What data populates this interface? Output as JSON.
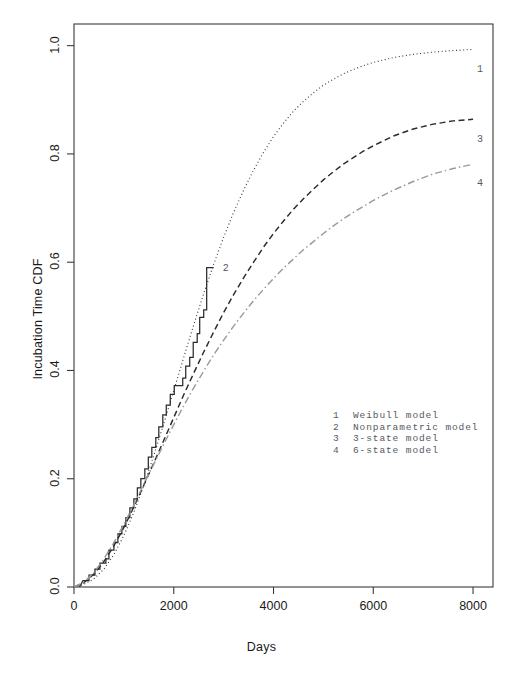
{
  "chart_data": {
    "type": "line",
    "title": "",
    "xlabel": "Days",
    "ylabel": "Incubation Time CDF",
    "xlim": [
      0,
      8400
    ],
    "ylim": [
      0.0,
      1.04
    ],
    "xticks": [
      0,
      2000,
      4000,
      6000,
      8000
    ],
    "xticklabels": [
      "0",
      "2000",
      "4000",
      "6000",
      "8000"
    ],
    "yticks": [
      0.0,
      0.2,
      0.4,
      0.6,
      0.8,
      1.0
    ],
    "yticklabels": [
      "0.0",
      "0.2",
      "0.4",
      "0.6",
      "0.8",
      "1.0"
    ],
    "grid": false,
    "legend_position": "inside-lower-right",
    "series": [
      {
        "key": "1",
        "name": "Weibull model",
        "style": "dotted",
        "color": "#3c3c3c",
        "end_value": 0.99,
        "points": [
          [
            0,
            0.0
          ],
          [
            200,
            0.005
          ],
          [
            400,
            0.015
          ],
          [
            600,
            0.033
          ],
          [
            800,
            0.06
          ],
          [
            1000,
            0.095
          ],
          [
            1200,
            0.138
          ],
          [
            1400,
            0.188
          ],
          [
            1600,
            0.243
          ],
          [
            1800,
            0.302
          ],
          [
            2000,
            0.363
          ],
          [
            2200,
            0.424
          ],
          [
            2400,
            0.484
          ],
          [
            2600,
            0.542
          ],
          [
            2800,
            0.596
          ],
          [
            3000,
            0.646
          ],
          [
            3200,
            0.692
          ],
          [
            3400,
            0.733
          ],
          [
            3600,
            0.77
          ],
          [
            3800,
            0.803
          ],
          [
            4000,
            0.832
          ],
          [
            4200,
            0.857
          ],
          [
            4400,
            0.879
          ],
          [
            4600,
            0.897
          ],
          [
            4800,
            0.913
          ],
          [
            5000,
            0.927
          ],
          [
            5200,
            0.938
          ],
          [
            5400,
            0.948
          ],
          [
            5600,
            0.956
          ],
          [
            5800,
            0.963
          ],
          [
            6000,
            0.969
          ],
          [
            6400,
            0.978
          ],
          [
            6800,
            0.984
          ],
          [
            7200,
            0.988
          ],
          [
            7600,
            0.991
          ],
          [
            8000,
            0.993
          ]
        ]
      },
      {
        "key": "2",
        "name": "Nonparametric model",
        "style": "step",
        "color": "#2b2b2b",
        "end_value": 0.59,
        "points": [
          [
            110,
            0.0
          ],
          [
            180,
            0.012
          ],
          [
            300,
            0.012
          ],
          [
            300,
            0.022
          ],
          [
            420,
            0.022
          ],
          [
            420,
            0.033
          ],
          [
            520,
            0.033
          ],
          [
            520,
            0.044
          ],
          [
            640,
            0.044
          ],
          [
            640,
            0.052
          ],
          [
            700,
            0.052
          ],
          [
            700,
            0.068
          ],
          [
            800,
            0.068
          ],
          [
            800,
            0.082
          ],
          [
            880,
            0.082
          ],
          [
            880,
            0.098
          ],
          [
            960,
            0.098
          ],
          [
            960,
            0.112
          ],
          [
            1040,
            0.112
          ],
          [
            1040,
            0.128
          ],
          [
            1120,
            0.128
          ],
          [
            1120,
            0.146
          ],
          [
            1200,
            0.146
          ],
          [
            1200,
            0.163
          ],
          [
            1270,
            0.163
          ],
          [
            1270,
            0.183
          ],
          [
            1340,
            0.183
          ],
          [
            1340,
            0.2
          ],
          [
            1420,
            0.2
          ],
          [
            1420,
            0.218
          ],
          [
            1490,
            0.218
          ],
          [
            1490,
            0.24
          ],
          [
            1560,
            0.24
          ],
          [
            1560,
            0.258
          ],
          [
            1640,
            0.258
          ],
          [
            1640,
            0.276
          ],
          [
            1700,
            0.276
          ],
          [
            1700,
            0.296
          ],
          [
            1780,
            0.296
          ],
          [
            1780,
            0.318
          ],
          [
            1850,
            0.318
          ],
          [
            1850,
            0.336
          ],
          [
            1930,
            0.336
          ],
          [
            1930,
            0.356
          ],
          [
            2010,
            0.356
          ],
          [
            2010,
            0.372
          ],
          [
            2180,
            0.372
          ],
          [
            2180,
            0.386
          ],
          [
            2240,
            0.386
          ],
          [
            2240,
            0.408
          ],
          [
            2320,
            0.408
          ],
          [
            2320,
            0.424
          ],
          [
            2390,
            0.424
          ],
          [
            2390,
            0.452
          ],
          [
            2470,
            0.452
          ],
          [
            2470,
            0.468
          ],
          [
            2520,
            0.468
          ],
          [
            2520,
            0.498
          ],
          [
            2600,
            0.498
          ],
          [
            2600,
            0.512
          ],
          [
            2660,
            0.512
          ],
          [
            2660,
            0.59
          ],
          [
            2800,
            0.59
          ]
        ]
      },
      {
        "key": "3",
        "name": "3-state model",
        "style": "dashed",
        "color": "#2b2b2b",
        "end_value": 0.86,
        "points": [
          [
            0,
            0.0
          ],
          [
            200,
            0.008
          ],
          [
            400,
            0.024
          ],
          [
            600,
            0.047
          ],
          [
            800,
            0.076
          ],
          [
            1000,
            0.11
          ],
          [
            1200,
            0.148
          ],
          [
            1400,
            0.188
          ],
          [
            1600,
            0.229
          ],
          [
            1800,
            0.271
          ],
          [
            2000,
            0.313
          ],
          [
            2200,
            0.355
          ],
          [
            2400,
            0.395
          ],
          [
            2600,
            0.434
          ],
          [
            2800,
            0.471
          ],
          [
            3000,
            0.507
          ],
          [
            3200,
            0.54
          ],
          [
            3400,
            0.571
          ],
          [
            3600,
            0.6
          ],
          [
            3800,
            0.628
          ],
          [
            4000,
            0.653
          ],
          [
            4200,
            0.676
          ],
          [
            4400,
            0.698
          ],
          [
            4600,
            0.717
          ],
          [
            4800,
            0.735
          ],
          [
            5000,
            0.752
          ],
          [
            5200,
            0.767
          ],
          [
            5400,
            0.781
          ],
          [
            5600,
            0.793
          ],
          [
            5800,
            0.805
          ],
          [
            6000,
            0.815
          ],
          [
            6400,
            0.833
          ],
          [
            6800,
            0.846
          ],
          [
            7200,
            0.855
          ],
          [
            7600,
            0.861
          ],
          [
            8000,
            0.864
          ]
        ]
      },
      {
        "key": "4",
        "name": "6-state model",
        "style": "dashdot",
        "color": "#9a9a9a",
        "end_value": 0.78,
        "points": [
          [
            0,
            0.0
          ],
          [
            200,
            0.009
          ],
          [
            400,
            0.027
          ],
          [
            600,
            0.052
          ],
          [
            800,
            0.082
          ],
          [
            1000,
            0.116
          ],
          [
            1200,
            0.152
          ],
          [
            1400,
            0.19
          ],
          [
            1600,
            0.227
          ],
          [
            1800,
            0.264
          ],
          [
            2000,
            0.3
          ],
          [
            2200,
            0.335
          ],
          [
            2400,
            0.368
          ],
          [
            2600,
            0.399
          ],
          [
            2800,
            0.429
          ],
          [
            3000,
            0.456
          ],
          [
            3200,
            0.482
          ],
          [
            3400,
            0.506
          ],
          [
            3600,
            0.529
          ],
          [
            3800,
            0.55
          ],
          [
            4000,
            0.57
          ],
          [
            4200,
            0.589
          ],
          [
            4400,
            0.606
          ],
          [
            4600,
            0.623
          ],
          [
            4800,
            0.638
          ],
          [
            5000,
            0.653
          ],
          [
            5200,
            0.667
          ],
          [
            5400,
            0.68
          ],
          [
            5600,
            0.692
          ],
          [
            5800,
            0.703
          ],
          [
            6000,
            0.714
          ],
          [
            6400,
            0.733
          ],
          [
            6800,
            0.749
          ],
          [
            7200,
            0.763
          ],
          [
            7600,
            0.773
          ],
          [
            8000,
            0.781
          ]
        ]
      }
    ],
    "curve_tags": [
      {
        "key": "1",
        "x": 8000,
        "y": 0.955
      },
      {
        "key": "2",
        "x": 2900,
        "y": 0.588
      },
      {
        "key": "3",
        "x": 8000,
        "y": 0.825
      },
      {
        "key": "4",
        "x": 8000,
        "y": 0.745
      }
    ]
  },
  "legend": {
    "entries": [
      {
        "key": "1",
        "label": "Weibull model"
      },
      {
        "key": "2",
        "label": "Nonparametric model"
      },
      {
        "key": "3",
        "label": "3-state model"
      },
      {
        "key": "4",
        "label": "6-state model"
      }
    ]
  },
  "colors": {
    "axis": "#3a3a3a",
    "text": "#1a1a1a",
    "legend_text": "#555a5e",
    "series4": "#9a9a9a",
    "background": "#ffffff"
  }
}
